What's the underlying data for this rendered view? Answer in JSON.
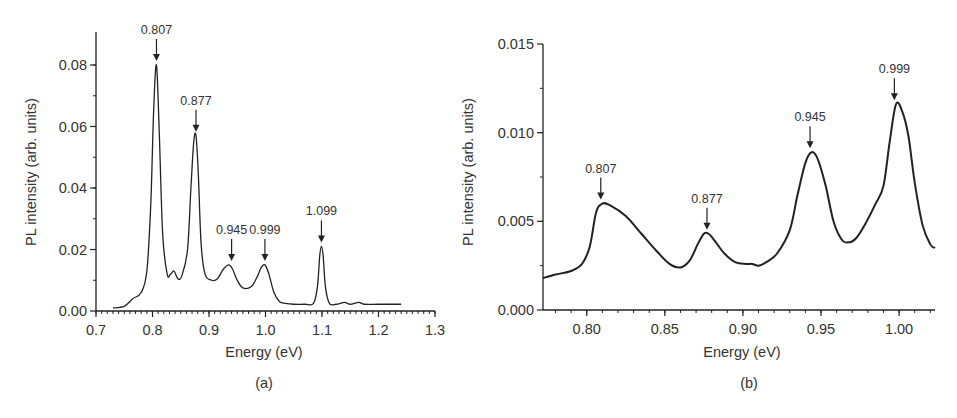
{
  "chart_data": [
    {
      "type": "line",
      "panel": "(a)",
      "xlabel": "Energy (eV)",
      "ylabel": "PL intensity (arb. units)",
      "xlim": [
        0.7,
        1.3
      ],
      "ylim": [
        0.0,
        0.09
      ],
      "xticks": [
        "0.7",
        "0.8",
        "0.9",
        "1.0",
        "1.1",
        "1.2",
        "1.3"
      ],
      "yticks": [
        "0.00",
        "0.02",
        "0.04",
        "0.06",
        "0.08"
      ],
      "grid": false,
      "annotations": [
        {
          "label": "0.807",
          "x": 0.807,
          "y": 0.08
        },
        {
          "label": "0.877",
          "x": 0.877,
          "y": 0.057
        },
        {
          "label": "0.945",
          "x": 0.94,
          "y": 0.015
        },
        {
          "label": "0.999",
          "x": 0.999,
          "y": 0.015
        },
        {
          "label": "1.099",
          "x": 1.099,
          "y": 0.021
        }
      ],
      "x": [
        0.73,
        0.75,
        0.765,
        0.78,
        0.79,
        0.797,
        0.802,
        0.807,
        0.812,
        0.818,
        0.826,
        0.832,
        0.838,
        0.845,
        0.852,
        0.862,
        0.868,
        0.873,
        0.877,
        0.881,
        0.886,
        0.893,
        0.905,
        0.915,
        0.925,
        0.935,
        0.942,
        0.95,
        0.96,
        0.975,
        0.985,
        0.992,
        0.999,
        1.006,
        1.015,
        1.025,
        1.035,
        1.05,
        1.07,
        1.085,
        1.092,
        1.096,
        1.099,
        1.102,
        1.106,
        1.113,
        1.125,
        1.14,
        1.15,
        1.165,
        1.175,
        1.2,
        1.24
      ],
      "values": [
        0.001,
        0.0015,
        0.004,
        0.006,
        0.013,
        0.035,
        0.065,
        0.08,
        0.058,
        0.025,
        0.012,
        0.012,
        0.013,
        0.0105,
        0.0115,
        0.02,
        0.04,
        0.055,
        0.057,
        0.045,
        0.022,
        0.012,
        0.01,
        0.0105,
        0.0135,
        0.015,
        0.0135,
        0.01,
        0.0075,
        0.008,
        0.011,
        0.014,
        0.015,
        0.012,
        0.006,
        0.003,
        0.0025,
        0.0022,
        0.0022,
        0.0025,
        0.008,
        0.018,
        0.021,
        0.018,
        0.008,
        0.0025,
        0.0022,
        0.0028,
        0.0022,
        0.0028,
        0.0022,
        0.0022,
        0.0022
      ]
    },
    {
      "type": "line",
      "panel": "(b)",
      "xlabel": "Energy (eV)",
      "ylabel": "PL intensity (arb. units)",
      "xlim": [
        0.772,
        1.023
      ],
      "ylim": [
        0.0,
        0.015
      ],
      "xticks": [
        "0.80",
        "0.85",
        "0.90",
        "0.95",
        "1.00"
      ],
      "yticks": [
        "0.000",
        "0.005",
        "0.010",
        "0.015"
      ],
      "grid": false,
      "annotations": [
        {
          "label": "0.807",
          "x": 0.809,
          "y": 0.006
        },
        {
          "label": "0.877",
          "x": 0.877,
          "y": 0.0043
        },
        {
          "label": "0.945",
          "x": 0.943,
          "y": 0.0089
        },
        {
          "label": "0.999",
          "x": 0.997,
          "y": 0.0116
        }
      ],
      "x": [
        0.772,
        0.78,
        0.79,
        0.797,
        0.802,
        0.806,
        0.81,
        0.815,
        0.825,
        0.835,
        0.845,
        0.853,
        0.86,
        0.866,
        0.871,
        0.875,
        0.878,
        0.882,
        0.888,
        0.895,
        0.902,
        0.906,
        0.91,
        0.915,
        0.922,
        0.93,
        0.935,
        0.94,
        0.944,
        0.948,
        0.953,
        0.958,
        0.963,
        0.967,
        0.972,
        0.978,
        0.985,
        0.99,
        0.994,
        0.998,
        1.002,
        1.006,
        1.01,
        1.015,
        1.02,
        1.023
      ],
      "values": [
        0.0018,
        0.002,
        0.0022,
        0.0026,
        0.0036,
        0.0055,
        0.006,
        0.0059,
        0.0053,
        0.0043,
        0.0033,
        0.0026,
        0.0024,
        0.0028,
        0.0037,
        0.0043,
        0.0043,
        0.0039,
        0.0032,
        0.0027,
        0.0026,
        0.0026,
        0.0025,
        0.0027,
        0.0032,
        0.0045,
        0.0065,
        0.0083,
        0.0089,
        0.0085,
        0.007,
        0.005,
        0.004,
        0.0038,
        0.004,
        0.0048,
        0.006,
        0.007,
        0.0095,
        0.0116,
        0.0112,
        0.0098,
        0.0072,
        0.0048,
        0.0037,
        0.0035
      ]
    }
  ],
  "panels": {
    "a": {
      "caption": "(a)",
      "xlabel": "Energy (eV)",
      "ylabel": "PL intensity (arb. units)"
    },
    "b": {
      "caption": "(b)",
      "xlabel": "Energy (eV)",
      "ylabel": "PL intensity (arb. units)"
    }
  }
}
